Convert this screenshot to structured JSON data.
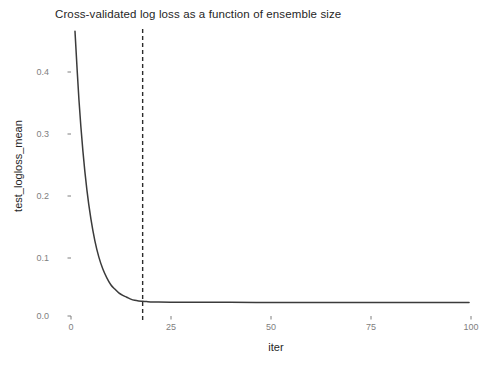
{
  "chart_data": {
    "type": "line",
    "title": "Cross-validated log loss as a function of ensemble size",
    "xlabel": "iter",
    "ylabel": "test_logloss_mean",
    "xlim": [
      0,
      103
    ],
    "ylim": [
      0.0,
      0.46
    ],
    "grid": false,
    "legend": "none",
    "x_ticks": [
      "0",
      "25",
      "50",
      "75",
      "100"
    ],
    "x_tick_values": [
      0,
      25,
      50,
      75,
      100
    ],
    "y_ticks": [
      "0.0",
      "0.1",
      "0.2",
      "0.3",
      "0.4"
    ],
    "y_tick_values": [
      0.0,
      0.1,
      0.2,
      0.3,
      0.4
    ],
    "series": [
      {
        "name": "test_logloss_mean",
        "line_color": "#3b3b3b",
        "x": [
          1,
          2,
          3,
          4,
          5,
          6,
          7,
          8,
          9,
          10,
          11,
          12,
          13,
          14,
          15,
          16,
          17,
          18,
          19,
          20,
          22,
          25,
          30,
          35,
          40,
          50,
          60,
          70,
          80,
          90,
          100
        ],
        "values": [
          0.455,
          0.345,
          0.263,
          0.201,
          0.155,
          0.12,
          0.094,
          0.075,
          0.061,
          0.05,
          0.043,
          0.037,
          0.033,
          0.03,
          0.027,
          0.025,
          0.024,
          0.0235,
          0.023,
          0.0225,
          0.0222,
          0.022,
          0.0219,
          0.0218,
          0.0218,
          0.0217,
          0.0217,
          0.0217,
          0.0216,
          0.0216,
          0.0216
        ]
      }
    ],
    "annotations": [
      {
        "type": "vertical-dashed-line",
        "x": 18,
        "color": "#2b2b2b",
        "dash": "4 3",
        "label": ""
      }
    ]
  }
}
